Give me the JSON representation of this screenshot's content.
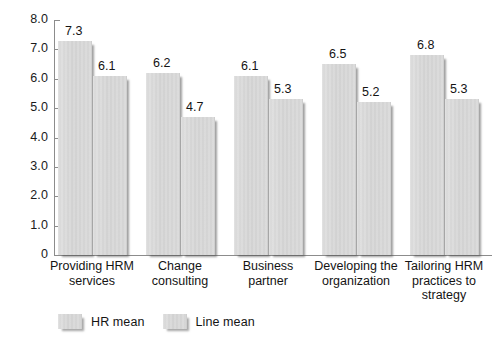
{
  "chart_data": {
    "type": "bar",
    "title": "",
    "subtitle": "",
    "xlabel": "",
    "ylabel": "",
    "ylim": [
      0,
      8
    ],
    "grid": false,
    "legend_position": "bottom-left",
    "yticks": [
      "8.0",
      "7.0",
      "6.0",
      "5.0",
      "4.0",
      "3.0",
      "2.0",
      "1.0",
      "0"
    ],
    "ytick_values": [
      8,
      7,
      6,
      5,
      4,
      3,
      2,
      1,
      0
    ],
    "categories": [
      "Providing HRM\nservices",
      "Change\nconsulting",
      "Business\npartner",
      "Developing the\norganization",
      "Tailoring HRM\npractices to\nstrategy"
    ],
    "series": [
      {
        "name": "HR mean",
        "values": [
          7.3,
          6.2,
          6.1,
          6.5,
          6.8
        ],
        "labels": [
          "7.3",
          "6.2",
          "6.1",
          "6.5",
          "6.8"
        ]
      },
      {
        "name": "Line mean",
        "values": [
          6.1,
          4.7,
          5.3,
          5.2,
          5.3
        ],
        "labels": [
          "6.1",
          "4.7",
          "5.3",
          "5.2",
          "5.3"
        ]
      }
    ],
    "colors": {
      "bar_fill": "#d5d5d5",
      "bar_shadow": "#808080",
      "axis": "#8c8c8c",
      "text": "#1a1a1a",
      "background": "#ffffff"
    }
  },
  "legend": {
    "items": [
      {
        "label": "HR mean"
      },
      {
        "label": "Line mean"
      }
    ]
  }
}
